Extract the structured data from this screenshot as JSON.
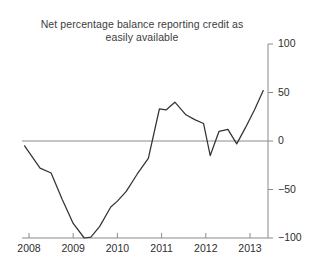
{
  "chart_data": {
    "type": "line",
    "title": "Net percentage balance reporting credit as easily available",
    "xlabel": "",
    "ylabel": "",
    "xlim": [
      2007.75,
      2013.35
    ],
    "ylim": [
      -100,
      100
    ],
    "grid": false,
    "legend": null,
    "zero_line": 0,
    "xticks": [
      2008,
      2009,
      2010,
      2011,
      2012,
      2013
    ],
    "xtick_labels": [
      "2008",
      "2009",
      "2010",
      "2011",
      "2012",
      "2013"
    ],
    "yticks": [
      -100,
      -50,
      0,
      50,
      100
    ],
    "ytick_labels": [
      "-100",
      "-50",
      "0",
      "50",
      "100"
    ],
    "yaxis_position": "right",
    "line_color": "#333333",
    "series": [
      {
        "name": "Net percentage balance",
        "x": [
          2007.9,
          2008.25,
          2008.5,
          2008.75,
          2009.0,
          2009.25,
          2009.4,
          2009.6,
          2009.85,
          2010.0,
          2010.2,
          2010.45,
          2010.7,
          2010.95,
          2011.1,
          2011.3,
          2011.55,
          2011.75,
          2011.95,
          2012.1,
          2012.3,
          2012.5,
          2012.7,
          2012.9,
          2013.1,
          2013.3
        ],
        "y": [
          -5,
          -28,
          -33,
          -60,
          -85,
          -100,
          -99,
          -88,
          -68,
          -62,
          -52,
          -34,
          -18,
          33,
          32,
          40,
          27,
          22,
          18,
          -15,
          10,
          12,
          -3,
          14,
          32,
          52
        ]
      }
    ]
  }
}
